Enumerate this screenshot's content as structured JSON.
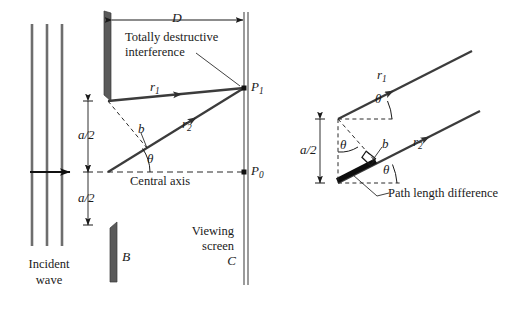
{
  "figure": {
    "colors": {
      "ink": "#1a1a1a",
      "ray": "#3c3c3c",
      "barrier_fill": "#5a5a5a",
      "wavefront": "#6e6e6e",
      "screen": "#7a7a7a",
      "dashed": "#2b2b2b",
      "background": "#ffffff"
    }
  },
  "left_panel": {
    "name": "slit-and-screen-geometry",
    "labels": {
      "distance_D": "D",
      "annotation_line1": "Totally destructive",
      "annotation_line2": "interference",
      "ray_r1": "r",
      "ray_r1_sub": "1",
      "ray_r2": "r",
      "ray_r2_sub": "2",
      "half_width_top": "a/2",
      "half_width_bottom": "a/2",
      "path_segment_b": "b",
      "angle_theta": "θ",
      "central_axis": "Central axis",
      "point_P1": "P",
      "point_P1_sub": "1",
      "point_P0": "P",
      "point_P0_sub": "0",
      "viewing_screen_line1": "Viewing",
      "viewing_screen_line2": "screen",
      "screen_letter": "C",
      "barrier_letter": "B",
      "incident_line1": "Incident",
      "incident_line2": "wave"
    }
  },
  "right_panel": {
    "name": "path-length-difference-detail",
    "labels": {
      "ray_r1": "r",
      "ray_r1_sub": "1",
      "ray_r2": "r",
      "ray_r2_sub": "2",
      "half_width": "a/2",
      "path_segment_b": "b",
      "angle_theta_upper": "θ",
      "angle_theta_middle": "θ",
      "angle_theta_lower": "θ",
      "path_length_difference": "Path length difference"
    }
  },
  "geometry": {
    "left": {
      "wavefront_x": [
        32,
        47,
        62
      ],
      "wavefront_y": [
        24,
        246
      ],
      "incident_arrow_y": 172,
      "dimension_x": 88,
      "slit_center_y": 172,
      "top_barrier": {
        "x": 104,
        "y_top": 11,
        "y_bottom": 101,
        "width": 7
      },
      "bottom_barrier": {
        "x": 110,
        "y_top": 222,
        "y_bottom": 282,
        "width": 7
      },
      "screen_x": 244,
      "screen_y": [
        12,
        285
      ],
      "P1_y": 88,
      "P0_y": 172,
      "D_arrow_y": 20,
      "upper_source": {
        "x": 108,
        "y": 101
      },
      "mid_source": {
        "x": 108,
        "y": 172
      }
    },
    "right": {
      "upper_source": {
        "x": 338,
        "y": 119
      },
      "lower_source": {
        "x": 338,
        "y": 183
      },
      "dimension_x": 320,
      "theta_deg": 27
    }
  }
}
